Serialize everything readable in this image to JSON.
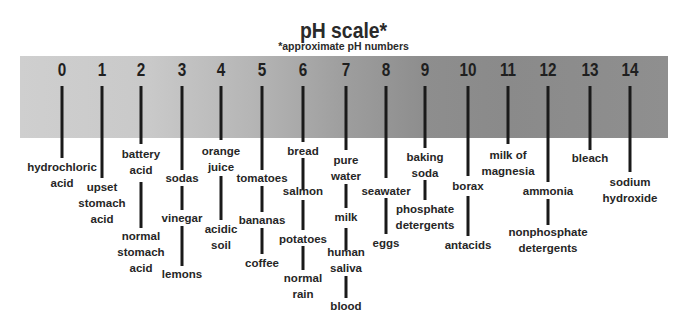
{
  "title": "pH scale*",
  "subtitle": "*approximate pH numbers",
  "colors": {
    "band_left": "#cfcfcf",
    "band_right": "#8f8f8f",
    "lines": "#1a1a1a",
    "text": "#262626"
  },
  "scale": [
    {
      "ph": "0",
      "x": 62
    },
    {
      "ph": "1",
      "x": 102
    },
    {
      "ph": "2",
      "x": 141
    },
    {
      "ph": "3",
      "x": 182
    },
    {
      "ph": "4",
      "x": 221
    },
    {
      "ph": "5",
      "x": 262
    },
    {
      "ph": "6",
      "x": 303
    },
    {
      "ph": "7",
      "x": 346
    },
    {
      "ph": "8",
      "x": 386
    },
    {
      "ph": "9",
      "x": 425
    },
    {
      "ph": "10",
      "x": 468
    },
    {
      "ph": "11",
      "x": 508
    },
    {
      "ph": "12",
      "x": 548
    },
    {
      "ph": "13",
      "x": 590
    },
    {
      "ph": "14",
      "x": 630
    }
  ],
  "substances": {
    "hydrochloric_acid": "hydrochloric\nacid",
    "upset_stomach_acid": "upset\nstomach\nacid",
    "battery_acid": "battery\nacid",
    "normal_stomach_acid": "normal\nstomach\nacid",
    "sodas": "sodas",
    "vinegar": "vinegar",
    "lemons": "lemons",
    "orange_juice": "orange\njuice",
    "acidic_soil": "acidic\nsoil",
    "tomatoes": "tomatoes",
    "bananas": "bananas",
    "coffee": "coffee",
    "bread": "bread",
    "salmon": "salmon",
    "potatoes": "potatoes",
    "normal_rain": "normal\nrain",
    "pure_water": "pure\nwater",
    "milk": "milk",
    "human_saliva": "human\nsaliva",
    "blood": "blood",
    "seawater": "seawater",
    "eggs": "eggs",
    "baking_soda": "baking\nsoda",
    "phosphate_detergents": "phosphate\ndetergents",
    "borax": "borax",
    "antacids": "antacids",
    "milk_of_magnesia": "milk of\nmagnesia",
    "ammonia": "ammonia",
    "nonphosphate_detergents": "nonphosphate\ndetergents",
    "bleach": "bleach",
    "sodium_hydroxide": "sodium\nhydroxide"
  }
}
